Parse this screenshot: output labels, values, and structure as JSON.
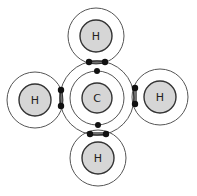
{
  "diagram": {
    "type": "dot-and-cross / bohr model of methane",
    "central_atom": {
      "symbol": "C",
      "cx": 97,
      "cy": 98
    },
    "atoms": [
      {
        "id": "h-top",
        "symbol": "H",
        "cx": 96,
        "cy": 36
      },
      {
        "id": "h-left",
        "symbol": "H",
        "cx": 35,
        "cy": 100
      },
      {
        "id": "h-right",
        "symbol": "H",
        "cx": 160,
        "cy": 97
      },
      {
        "id": "h-bottom",
        "symbol": "H",
        "cx": 98,
        "cy": 158
      }
    ],
    "colors": {
      "nucleus_fill": "#d6d6d6",
      "electron": "#111111",
      "shell": "#555555"
    }
  }
}
